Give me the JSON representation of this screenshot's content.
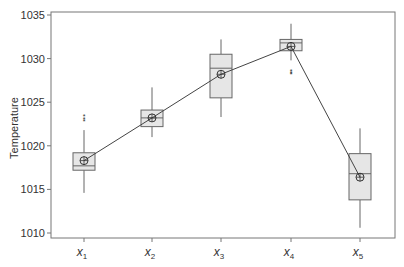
{
  "chart_data": {
    "type": "boxplot",
    "title": "",
    "xlabel": "",
    "ylabel": "Temperature",
    "ylim": [
      1010,
      1035
    ],
    "yticks": [
      1010,
      1015,
      1020,
      1025,
      1030,
      1035
    ],
    "grid": false,
    "legend": null,
    "categories": [
      "x1",
      "x2",
      "x3",
      "x4",
      "x5"
    ],
    "boxes": [
      {
        "label": "x1",
        "whisker_low": 1014.6,
        "q1": 1017.2,
        "median": 1017.7,
        "q3": 1019.2,
        "whisker_high": 1021.8,
        "mean": 1018.3,
        "outliers": [
          1022.8,
          1023.1,
          1023.4
        ]
      },
      {
        "label": "x2",
        "whisker_low": 1021.0,
        "q1": 1022.2,
        "median": 1023.2,
        "q3": 1024.1,
        "whisker_high": 1026.7,
        "mean": 1023.2,
        "outliers": []
      },
      {
        "label": "x3",
        "whisker_low": 1023.3,
        "q1": 1025.5,
        "median": 1028.9,
        "q3": 1030.5,
        "whisker_high": 1032.2,
        "mean": 1028.2,
        "outliers": []
      },
      {
        "label": "x4",
        "whisker_low": 1029.8,
        "q1": 1030.9,
        "median": 1031.8,
        "q3": 1032.2,
        "whisker_high": 1034.0,
        "mean": 1031.4,
        "outliers": [
          1028.2,
          1028.4,
          1028.6
        ]
      },
      {
        "label": "x5",
        "whisker_low": 1010.6,
        "q1": 1013.8,
        "median": 1016.8,
        "q3": 1019.1,
        "whisker_high": 1022.0,
        "mean": 1016.4,
        "outliers": []
      }
    ],
    "mean_line": {
      "connects": "means",
      "values": [
        1018.3,
        1023.2,
        1028.2,
        1031.4,
        1016.4
      ]
    },
    "colors": {
      "box_fill": "#e6e6e6",
      "box_stroke": "#666666",
      "line": "#444444",
      "frame": "#777777"
    }
  },
  "labels": {
    "ylabel": "Temperature",
    "x": [
      {
        "base": "x",
        "sub": "1"
      },
      {
        "base": "x",
        "sub": "2"
      },
      {
        "base": "x",
        "sub": "3"
      },
      {
        "base": "x",
        "sub": "4"
      },
      {
        "base": "x",
        "sub": "5"
      }
    ]
  }
}
